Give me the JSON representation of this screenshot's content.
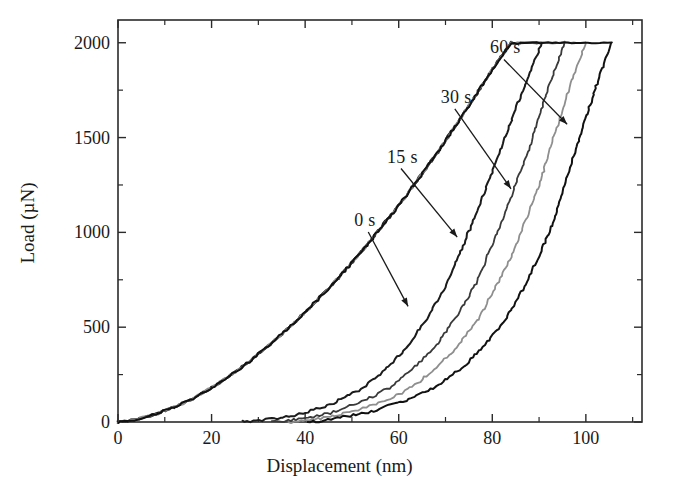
{
  "chart_data": {
    "type": "line",
    "title": "",
    "xlabel": "Displacement (nm)",
    "ylabel": "Load (µN)",
    "xlim": [
      0,
      112
    ],
    "ylim": [
      0,
      2120
    ],
    "grid": false,
    "legend_position": "inline-annotations",
    "xticks": [
      0,
      20,
      40,
      60,
      80,
      100
    ],
    "xtick_labels": [
      "0",
      "20",
      "40",
      "60",
      "80",
      "100"
    ],
    "x_minor_ticks": [
      10,
      30,
      50,
      70,
      90,
      110
    ],
    "yticks": [
      0,
      500,
      1000,
      1500,
      2000
    ],
    "ytick_labels": [
      "0",
      "500",
      "1000",
      "1500",
      "2000"
    ],
    "y_minor_ticks": [
      250,
      750,
      1250,
      1750
    ],
    "peak_load": 2000,
    "annotations": [
      {
        "label": "0 s",
        "label_x": 50.5,
        "label_y": 1065,
        "tip_x": 62.0,
        "tip_y": 610
      },
      {
        "label": "15 s",
        "label_x": 57.5,
        "label_y": 1400,
        "tip_x": 72.5,
        "tip_y": 975
      },
      {
        "label": "30 s",
        "label_x": 69.0,
        "label_y": 1715,
        "tip_x": 84.0,
        "tip_y": 1230
      },
      {
        "label": "60 s",
        "label_x": 79.5,
        "label_y": 1975,
        "tip_x": 96.0,
        "tip_y": 1570
      }
    ],
    "series": [
      {
        "name": "0 s",
        "hold_time_s": 0,
        "color": "#1b1b1b",
        "max_depth_nm": 90.5,
        "residual_depth_nm": 26.5,
        "loading": [
          [
            0,
            0
          ],
          [
            4,
            14
          ],
          [
            8,
            40
          ],
          [
            12,
            78
          ],
          [
            16,
            125
          ],
          [
            20,
            180
          ],
          [
            24,
            245
          ],
          [
            28,
            318
          ],
          [
            32,
            398
          ],
          [
            36,
            485
          ],
          [
            40,
            578
          ],
          [
            44,
            678
          ],
          [
            48,
            785
          ],
          [
            52,
            898
          ],
          [
            56,
            1018
          ],
          [
            60,
            1143
          ],
          [
            64,
            1275
          ],
          [
            68,
            1412
          ],
          [
            72,
            1556
          ],
          [
            76,
            1705
          ],
          [
            80,
            1860
          ],
          [
            84,
            2000
          ],
          [
            86,
            2000
          ]
        ],
        "hold": [
          [
            86,
            2000
          ],
          [
            90.5,
            2000
          ]
        ],
        "unloading": [
          [
            90.5,
            2000
          ],
          [
            88,
            1840
          ],
          [
            85,
            1650
          ],
          [
            82,
            1450
          ],
          [
            79,
            1255
          ],
          [
            76,
            1065
          ],
          [
            73,
            885
          ],
          [
            70,
            715
          ],
          [
            66,
            545
          ],
          [
            62,
            400
          ],
          [
            57,
            272
          ],
          [
            52,
            175
          ],
          [
            46,
            100
          ],
          [
            40,
            48
          ],
          [
            34,
            18
          ],
          [
            29,
            4
          ],
          [
            26.5,
            0
          ]
        ]
      },
      {
        "name": "15 s",
        "hold_time_s": 15,
        "color": "#3a3a3a",
        "max_depth_nm": 95.5,
        "residual_depth_nm": 33.0,
        "loading": [
          [
            0,
            0
          ],
          [
            4,
            14
          ],
          [
            8,
            40
          ],
          [
            12,
            78
          ],
          [
            16,
            125
          ],
          [
            20,
            180
          ],
          [
            24,
            245
          ],
          [
            28,
            318
          ],
          [
            32,
            398
          ],
          [
            36,
            485
          ],
          [
            40,
            578
          ],
          [
            44,
            678
          ],
          [
            48,
            785
          ],
          [
            52,
            898
          ],
          [
            56,
            1018
          ],
          [
            60,
            1143
          ],
          [
            64,
            1275
          ],
          [
            68,
            1412
          ],
          [
            72,
            1556
          ],
          [
            76,
            1705
          ],
          [
            80,
            1860
          ],
          [
            84,
            2000
          ],
          [
            86,
            2000
          ]
        ],
        "hold": [
          [
            86,
            2000
          ],
          [
            95.5,
            2000
          ]
        ],
        "unloading": [
          [
            95.5,
            2000
          ],
          [
            93,
            1835
          ],
          [
            90.5,
            1650
          ],
          [
            88,
            1455
          ],
          [
            85,
            1255
          ],
          [
            82,
            1058
          ],
          [
            79,
            875
          ],
          [
            76,
            705
          ],
          [
            72,
            545
          ],
          [
            68,
            405
          ],
          [
            63,
            280
          ],
          [
            58,
            180
          ],
          [
            52,
            105
          ],
          [
            46,
            52
          ],
          [
            40,
            19
          ],
          [
            35,
            4
          ],
          [
            33,
            0
          ]
        ]
      },
      {
        "name": "30 s",
        "hold_time_s": 30,
        "color": "#8e8e8e",
        "max_depth_nm": 100.0,
        "residual_depth_nm": 36.5,
        "loading": [
          [
            0,
            0
          ],
          [
            4,
            14
          ],
          [
            8,
            40
          ],
          [
            12,
            78
          ],
          [
            16,
            125
          ],
          [
            20,
            180
          ],
          [
            24,
            245
          ],
          [
            28,
            318
          ],
          [
            32,
            398
          ],
          [
            36,
            485
          ],
          [
            40,
            578
          ],
          [
            44,
            678
          ],
          [
            48,
            785
          ],
          [
            52,
            898
          ],
          [
            56,
            1018
          ],
          [
            60,
            1143
          ],
          [
            64,
            1275
          ],
          [
            68,
            1412
          ],
          [
            72,
            1556
          ],
          [
            76,
            1705
          ],
          [
            80,
            1860
          ],
          [
            84,
            2000
          ],
          [
            86,
            2000
          ]
        ],
        "hold": [
          [
            86,
            2000
          ],
          [
            100,
            2000
          ]
        ],
        "unloading": [
          [
            100,
            2000
          ],
          [
            97.5,
            1830
          ],
          [
            95,
            1645
          ],
          [
            92.5,
            1450
          ],
          [
            90,
            1250
          ],
          [
            87,
            1055
          ],
          [
            84,
            872
          ],
          [
            80.5,
            700
          ],
          [
            77,
            545
          ],
          [
            73,
            408
          ],
          [
            68,
            285
          ],
          [
            63,
            185
          ],
          [
            57,
            110
          ],
          [
            50,
            55
          ],
          [
            44,
            21
          ],
          [
            39,
            5
          ],
          [
            36.5,
            0
          ]
        ]
      },
      {
        "name": "60 s",
        "hold_time_s": 60,
        "color": "#111111",
        "max_depth_nm": 105.5,
        "residual_depth_nm": 40.5,
        "loading": [
          [
            0,
            0
          ],
          [
            4,
            14
          ],
          [
            8,
            40
          ],
          [
            12,
            78
          ],
          [
            16,
            125
          ],
          [
            20,
            180
          ],
          [
            24,
            245
          ],
          [
            28,
            318
          ],
          [
            32,
            398
          ],
          [
            36,
            485
          ],
          [
            40,
            578
          ],
          [
            44,
            678
          ],
          [
            48,
            785
          ],
          [
            52,
            898
          ],
          [
            56,
            1018
          ],
          [
            60,
            1143
          ],
          [
            64,
            1275
          ],
          [
            68,
            1412
          ],
          [
            72,
            1556
          ],
          [
            76,
            1705
          ],
          [
            80,
            1860
          ],
          [
            84,
            2000
          ],
          [
            86,
            2000
          ]
        ],
        "hold": [
          [
            86,
            2000
          ],
          [
            105.5,
            2000
          ]
        ],
        "unloading": [
          [
            105.5,
            2000
          ],
          [
            103,
            1830
          ],
          [
            100.5,
            1645
          ],
          [
            98,
            1450
          ],
          [
            95.5,
            1250
          ],
          [
            93,
            1055
          ],
          [
            90,
            872
          ],
          [
            86.5,
            700
          ],
          [
            83,
            545
          ],
          [
            78.5,
            408
          ],
          [
            73.5,
            285
          ],
          [
            68,
            185
          ],
          [
            61,
            110
          ],
          [
            54,
            55
          ],
          [
            47,
            21
          ],
          [
            43,
            5
          ],
          [
            40.5,
            0
          ]
        ]
      }
    ]
  }
}
